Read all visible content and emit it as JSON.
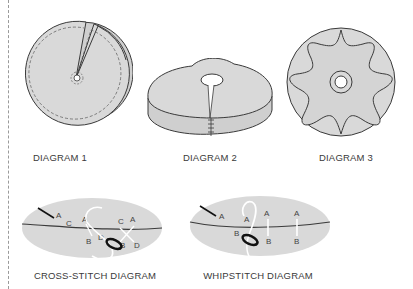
{
  "diagrams": [
    {
      "id": "diagram-1",
      "caption": "DIAGRAM 1"
    },
    {
      "id": "diagram-2",
      "caption": "DIAGRAM 2"
    },
    {
      "id": "diagram-3",
      "caption": "DIAGRAM 3"
    },
    {
      "id": "cross-stitch",
      "caption": "CROSS-STITCH DIAGRAM",
      "labels": {
        "a1": "A",
        "c1": "C",
        "a2": "A",
        "c2": "C",
        "a3": "A",
        "b1": "B",
        "d1": "D",
        "b2": "B",
        "d2": "D"
      }
    },
    {
      "id": "whipstitch",
      "caption": "WHIPSTITCH DIAGRAM",
      "labels": {
        "a1": "A",
        "a2": "A",
        "a3": "A",
        "a4": "A",
        "b1": "B",
        "b2": "B",
        "b3": "B"
      }
    }
  ],
  "colors": {
    "fill": "#d9d9d9",
    "stroke": "#3a3a3a",
    "caption": "#3a3a3a",
    "thread": "#ffffff",
    "needle": "#111111"
  }
}
